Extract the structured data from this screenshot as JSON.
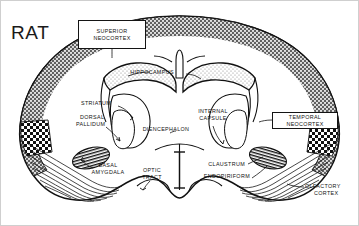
{
  "figure": {
    "species_title": "RAT",
    "background_color": "#ffffff",
    "ink_color": "#111111",
    "frame_color": "#cfcfcf"
  },
  "boxed_labels": [
    {
      "name": "superior-neocortex",
      "line1": "SUPERIOR",
      "line2": "NEOCORTEX",
      "x": 78,
      "y": 20,
      "w": 68,
      "h": 29
    },
    {
      "name": "temporal-neocortex",
      "line1": "TEMPORAL",
      "line2": "NEOCORTEX",
      "x": 272,
      "y": 112,
      "w": 66,
      "h": 17
    }
  ],
  "labels": [
    {
      "name": "hippocampus",
      "text": "HIPPOCAMPUS",
      "x": 152,
      "y": 72,
      "align": "center"
    },
    {
      "name": "striatum",
      "text": "STRIATUM",
      "x": 96,
      "y": 103,
      "align": "center"
    },
    {
      "name": "dorsal",
      "text": "DORSAL",
      "x": 82,
      "y": 117,
      "align": "left"
    },
    {
      "name": "pallidum",
      "text": "PALLIDUM",
      "x": 78,
      "y": 124,
      "align": "left"
    },
    {
      "name": "diencephalon",
      "text": "DIENCEPHALON",
      "x": 166,
      "y": 129,
      "align": "center"
    },
    {
      "name": "internal",
      "text": "INTERNAL",
      "x": 213,
      "y": 111,
      "align": "center"
    },
    {
      "name": "capsule",
      "text": "CAPSULE",
      "x": 213,
      "y": 118,
      "align": "center"
    },
    {
      "name": "basal",
      "text": "BASAL",
      "x": 108,
      "y": 165,
      "align": "center"
    },
    {
      "name": "amygdala",
      "text": "AMYGDALA",
      "x": 108,
      "y": 172,
      "align": "center"
    },
    {
      "name": "optic",
      "text": "OPTIC",
      "x": 152,
      "y": 170,
      "align": "center"
    },
    {
      "name": "tract",
      "text": "TRACT",
      "x": 152,
      "y": 177,
      "align": "center"
    },
    {
      "name": "claustrum",
      "text": "CLAUSTRUM",
      "x": 245,
      "y": 164,
      "align": "right"
    },
    {
      "name": "endopiriform",
      "text": "ENDOPIRIFORM",
      "x": 250,
      "y": 176,
      "align": "right"
    },
    {
      "name": "olfactory",
      "text": "OLFACTORY",
      "x": 307,
      "y": 186,
      "align": "left"
    },
    {
      "name": "cortex",
      "text": "CORTEX",
      "x": 316,
      "y": 193,
      "align": "left"
    }
  ],
  "regions": [
    {
      "name": "superior-neocortex-band",
      "fill": "stipple-dark"
    },
    {
      "name": "hippocampus-body",
      "fill": "stipple-light"
    },
    {
      "name": "temporal-neocortex-band",
      "fill": "checker"
    },
    {
      "name": "basal-amygdala-nucleus",
      "fill": "hatch"
    },
    {
      "name": "claustrum-endopiriform",
      "fill": "hatch"
    },
    {
      "name": "olfactory-cortex-layer",
      "fill": "diagonal-lines"
    },
    {
      "name": "diencephalon-core",
      "fill": "plain-white"
    }
  ]
}
